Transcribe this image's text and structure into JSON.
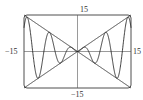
{
  "chart_data": {
    "type": "line",
    "title": "",
    "xlabel": "",
    "ylabel": "",
    "xlim": [
      -15,
      15
    ],
    "ylim": [
      -15,
      15
    ],
    "grid": false,
    "legend": null,
    "series": [
      {
        "name": "y = x sin x",
        "expression": "x*sin(x)",
        "x": [
          -15,
          -14.14,
          -10.99,
          -7.85,
          -4.71,
          -1.57,
          0,
          1.57,
          4.71,
          7.85,
          10.99,
          14.14,
          15
        ],
        "values": [
          9.75,
          14.14,
          -10.99,
          7.85,
          -4.71,
          1.57,
          0,
          1.57,
          -4.71,
          7.85,
          -10.99,
          14.14,
          9.75
        ]
      },
      {
        "name": "y = x",
        "expression": "x",
        "x": [
          -15,
          15
        ],
        "values": [
          -15,
          15
        ]
      },
      {
        "name": "y = -x",
        "expression": "-x",
        "x": [
          -15,
          15
        ],
        "values": [
          15,
          -15
        ]
      }
    ],
    "tick_labels": {
      "top": "15",
      "bottom": "−15",
      "left": "−15",
      "right": "15"
    }
  },
  "colors": {
    "line": "#2a2a2a",
    "frame": "#3a3a3a",
    "background": "#ffffff"
  }
}
